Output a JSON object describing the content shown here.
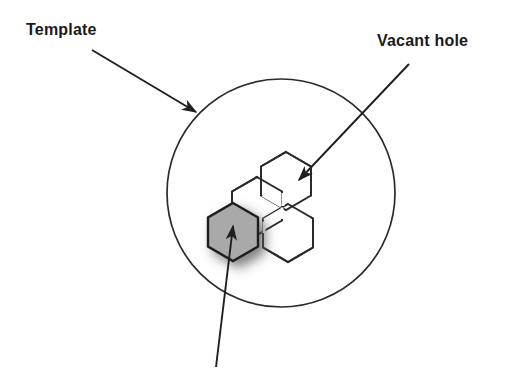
{
  "figure": {
    "title_labels": {
      "template": "Template",
      "vacant_hole": "Vacant hole"
    },
    "colors": {
      "stroke": "#2b2b2b",
      "hexagon_filled_fill": "#a9a9a9",
      "background": "#ffffff",
      "text": "#1a1a1a",
      "shadow": "#808080"
    },
    "shapes": {
      "template_circle": {
        "name": "template-circle",
        "cx": 281,
        "cy": 193,
        "r": 114,
        "fill": "none"
      },
      "vacant_hole_cluster": {
        "name": "vacant-hole-trefoil",
        "hexagon_count": 3,
        "orientation": "pointy-top",
        "centers": [
          {
            "cx": 286,
            "cy": 181
          },
          {
            "cx": 257,
            "cy": 206
          },
          {
            "cx": 288,
            "cy": 233
          }
        ],
        "hex_radius": 29,
        "fill": "none"
      },
      "filled_hexagon": {
        "name": "shaded-hexagon",
        "cx": 233,
        "cy": 232,
        "r": 29,
        "fill": "#a9a9a9",
        "has_shadow": true
      }
    },
    "annotations": [
      {
        "name": "template-arrow",
        "from_x": 92,
        "from_y": 50,
        "to_x": 199,
        "to_y": 114
      },
      {
        "name": "vacant-hole-arrow",
        "from_x": 409,
        "from_y": 64,
        "to_x": 296,
        "to_y": 183
      },
      {
        "name": "shaded-hexagon-arrow",
        "from_x": 216,
        "from_y": 367,
        "to_x": 233,
        "to_y": 222
      }
    ]
  }
}
